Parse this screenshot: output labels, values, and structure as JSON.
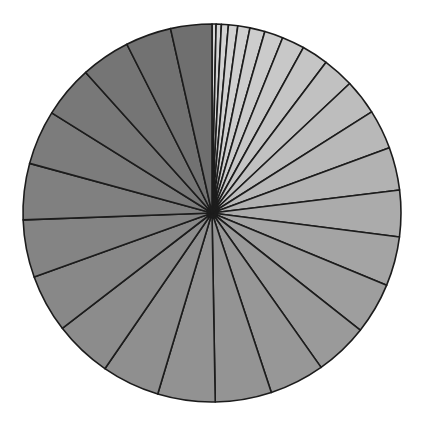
{
  "figure": {
    "kind": "pie-chart-figure",
    "background_color": "#ffffff",
    "width": 424,
    "height": 430
  },
  "chart_data": {
    "type": "pie",
    "title": "",
    "subtitle": "",
    "xlabel": "",
    "ylabel": "",
    "legend": [],
    "annotations": [],
    "grid": false,
    "start_angle_deg": -90,
    "direction": "clockwise",
    "center_x": 212,
    "center_y": 213,
    "radius": 189,
    "edge_color": "#1c1c1c",
    "edge_width": 1.6,
    "total": 100,
    "slice_count": 30,
    "labels": [
      "s1",
      "s2",
      "s3",
      "s4",
      "s5",
      "s6",
      "s7",
      "s8",
      "s9",
      "s10",
      "s11",
      "s12",
      "s13",
      "s14",
      "s15",
      "s16",
      "s17",
      "s18",
      "s19",
      "s20",
      "s21",
      "s22",
      "s23",
      "s24",
      "s25",
      "s26",
      "s27",
      "s28",
      "s29",
      "s30"
    ],
    "values": [
      0.35,
      0.45,
      0.6,
      0.8,
      1.05,
      1.3,
      1.6,
      1.95,
      2.3,
      2.7,
      3.05,
      3.4,
      3.7,
      4.0,
      4.25,
      4.45,
      4.6,
      4.75,
      4.85,
      4.95,
      5.0,
      5.0,
      5.0,
      4.95,
      4.85,
      4.7,
      4.5,
      4.25,
      3.95,
      3.55
    ],
    "colors": [
      "#d6d6d6",
      "#d4d4d4",
      "#d3d3d3",
      "#d1d1d1",
      "#cfcfcf",
      "#cdcdcd",
      "#cbcbcb",
      "#c8c8c8",
      "#c5c5c5",
      "#c1c1c1",
      "#bdbdbd",
      "#b8b8b8",
      "#b2b2b2",
      "#ababab",
      "#a4a4a4",
      "#9e9e9e",
      "#9a9a9a",
      "#979797",
      "#949494",
      "#929292",
      "#8f8f8f",
      "#8c8c8c",
      "#888888",
      "#848484",
      "#808080",
      "#7c7c7c",
      "#787878",
      "#757575",
      "#727272",
      "#6f6f6f"
    ]
  }
}
